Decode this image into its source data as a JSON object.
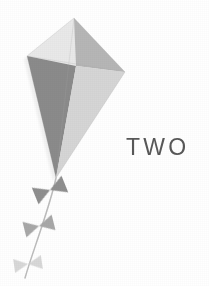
{
  "page": {
    "width": 209,
    "height": 286,
    "background_color": "#ffffff",
    "kind": "decorative-illustration"
  },
  "wordmark": {
    "text": "TWO",
    "color": "#4a4a4a"
  },
  "illustration": {
    "name": "kite-illustration",
    "title": "Gray kite with bow tail",
    "palette": {
      "panel_top_left": "#e9e9e9",
      "panel_top_right": "#b6b6b6",
      "panel_bottom_left": "#8b8b8b",
      "panel_bottom_right": "#d6d6d6",
      "outline": "#9a9a9a",
      "tail_string": "#b9b9b9",
      "bow_dark": "#8f8f8f",
      "bow_mid": "#a8a8a8",
      "bow_light": "#cfcfcf",
      "shadow": "#e4e4e4"
    },
    "kite_vertices": {
      "top": [
        74,
        18
      ],
      "left": [
        27,
        56
      ],
      "right": [
        125,
        72
      ],
      "bottom": [
        56,
        178
      ],
      "center": [
        76,
        66
      ]
    },
    "bows": [
      {
        "label": "bow-1",
        "center": [
          50,
          190
        ],
        "size": 30,
        "rotation": -22,
        "tone": "bow_dark"
      },
      {
        "label": "bow-2",
        "center": [
          39,
          226
        ],
        "size": 28,
        "rotation": -14,
        "tone": "bow_mid"
      },
      {
        "label": "bow-3",
        "center": [
          28,
          264
        ],
        "size": 26,
        "rotation": -8,
        "tone": "bow_light"
      }
    ],
    "tail_path": "M56,178 C52,196 46,214 40,232 C34,250 29,264 25,278"
  }
}
